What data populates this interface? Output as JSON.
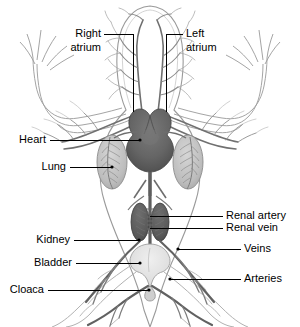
{
  "figure": {
    "background_color": "#ffffff",
    "width": 300,
    "height": 327
  },
  "colors": {
    "ink": "#000000",
    "heart": "#6a6a6a",
    "heart_shade": "#575757",
    "lung": "#c4c4c4",
    "kidney": "#5f5f5f",
    "bladder": "#e2e2e2",
    "vessel_dark": "#606060",
    "vessel_light": "#b0b0b0",
    "outline": "#8a8a8a"
  },
  "labels": [
    {
      "id": "right-atrium",
      "text": "Right\natrium",
      "line1": "Right",
      "line2": "atrium",
      "side": "left",
      "text_x": 101,
      "text_y": 34,
      "leader": [
        [
          104,
          34
        ],
        [
          133,
          34
        ],
        [
          133,
          112
        ]
      ]
    },
    {
      "id": "left-atrium",
      "text": "Left\natrium",
      "line1": "Left",
      "line2": "atrium",
      "side": "right",
      "text_x": 186,
      "text_y": 34,
      "leader": [
        [
          183,
          34
        ],
        [
          166,
          34
        ],
        [
          166,
          112
        ]
      ]
    },
    {
      "id": "heart",
      "text": "Heart",
      "line1": "Heart",
      "line2": "",
      "side": "left",
      "text_x": 46,
      "text_y": 140,
      "leader": [
        [
          50,
          140
        ],
        [
          140,
          140
        ]
      ]
    },
    {
      "id": "lung",
      "text": "Lung",
      "line1": "Lung",
      "line2": "",
      "side": "left",
      "text_x": 66,
      "text_y": 167,
      "leader": [
        [
          70,
          167
        ],
        [
          112,
          167
        ]
      ]
    },
    {
      "id": "kidney",
      "text": "Kidney",
      "line1": "Kidney",
      "line2": "",
      "side": "left",
      "text_x": 70,
      "text_y": 240,
      "leader": [
        [
          74,
          240
        ],
        [
          139,
          240
        ]
      ]
    },
    {
      "id": "bladder",
      "text": "Bladder",
      "line1": "Bladder",
      "line2": "",
      "side": "left",
      "text_x": 72,
      "text_y": 263,
      "leader": [
        [
          76,
          263
        ],
        [
          140,
          263
        ]
      ]
    },
    {
      "id": "cloaca",
      "text": "Cloaca",
      "line1": "Cloaca",
      "line2": "",
      "side": "left",
      "text_x": 44,
      "text_y": 290,
      "leader": [
        [
          48,
          290
        ],
        [
          149,
          290
        ]
      ]
    },
    {
      "id": "renal-artery",
      "text": "Renal artery",
      "line1": "Renal artery",
      "line2": "",
      "side": "right",
      "text_x": 226,
      "text_y": 216,
      "leader": [
        [
          223,
          216
        ],
        [
          196,
          216
        ]
      ]
    },
    {
      "id": "renal-vein",
      "text": "Renal vein",
      "line1": "Renal vein",
      "line2": "",
      "side": "right",
      "text_x": 226,
      "text_y": 228,
      "leader": [
        [
          223,
          228
        ],
        [
          196,
          228
        ]
      ]
    },
    {
      "id": "veins",
      "text": "Veins",
      "line1": "Veins",
      "line2": "",
      "side": "right",
      "text_x": 244,
      "text_y": 249,
      "leader": [
        [
          241,
          249
        ],
        [
          178,
          249
        ]
      ]
    },
    {
      "id": "arteries",
      "text": "Arteries",
      "line1": "Arteries",
      "line2": "",
      "side": "right",
      "text_x": 244,
      "text_y": 279,
      "leader": [
        [
          241,
          279
        ],
        [
          170,
          279
        ]
      ]
    }
  ],
  "anatomy": {
    "heart": {
      "name": "heart",
      "center_x": 150,
      "atria_y": 118,
      "ventricle_y": 138
    },
    "lungs": [
      {
        "name": "right-lung",
        "cx": 112,
        "cy": 162,
        "rx": 15,
        "ry": 26
      },
      {
        "name": "left-lung",
        "cx": 188,
        "cy": 162,
        "rx": 15,
        "ry": 26
      }
    ],
    "kidneys": [
      {
        "name": "right-kidney",
        "cx": 140,
        "cy": 222,
        "rx": 9,
        "ry": 19
      },
      {
        "name": "left-kidney",
        "cx": 160,
        "cy": 222,
        "rx": 9,
        "ry": 19
      }
    ],
    "bladder": {
      "name": "bladder",
      "cx": 150,
      "cy": 262
    },
    "cloaca": {
      "name": "cloaca",
      "cx": 150,
      "cy": 288
    }
  }
}
